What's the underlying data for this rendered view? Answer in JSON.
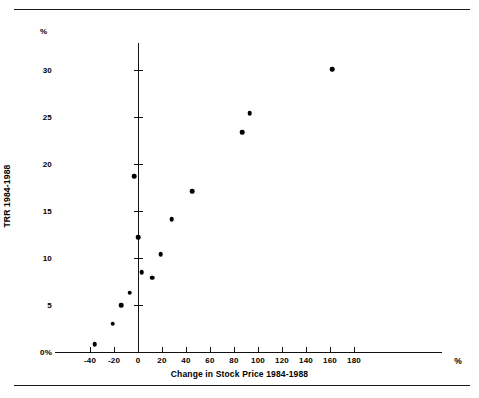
{
  "figure": {
    "top_fragment": "",
    "rules": [
      "top-rule",
      "bottom-rule"
    ]
  },
  "chart_data": {
    "type": "scatter",
    "title": "",
    "xlabel": "Change in Stock Price 1984-1988",
    "ylabel": "TRR 1984-1988",
    "x_unit": "%",
    "y_unit": "%",
    "xlim": [
      -40,
      180
    ],
    "ylim": [
      0,
      30
    ],
    "grid": false,
    "legend": null,
    "xticks": [
      -40,
      -20,
      0,
      20,
      40,
      60,
      80,
      100,
      120,
      140,
      160,
      180
    ],
    "xtick_labels": [
      "-40",
      "-20",
      "0",
      "20",
      "40",
      "60",
      "80",
      "100",
      "120",
      "140",
      "160",
      "180"
    ],
    "yticks": [
      0,
      5,
      10,
      15,
      20,
      25,
      30
    ],
    "ytick_labels": [
      "0%",
      "5",
      "10",
      "15",
      "20",
      "25",
      "30"
    ],
    "marker": "filled-circle",
    "marker_color": "#000000",
    "points": [
      {
        "x": -36,
        "y": 0.8
      },
      {
        "x": -21,
        "y": 3.0
      },
      {
        "x": -14,
        "y": 5.0
      },
      {
        "x": -7,
        "y": 6.3
      },
      {
        "x": -3,
        "y": 18.7
      },
      {
        "x": 0,
        "y": 12.2
      },
      {
        "x": 3,
        "y": 8.5
      },
      {
        "x": 12,
        "y": 7.9
      },
      {
        "x": 19,
        "y": 10.4
      },
      {
        "x": 28,
        "y": 14.1
      },
      {
        "x": 45,
        "y": 17.1
      },
      {
        "x": 87,
        "y": 23.4
      },
      {
        "x": 93,
        "y": 25.4
      },
      {
        "x": 162,
        "y": 30.1
      }
    ]
  }
}
